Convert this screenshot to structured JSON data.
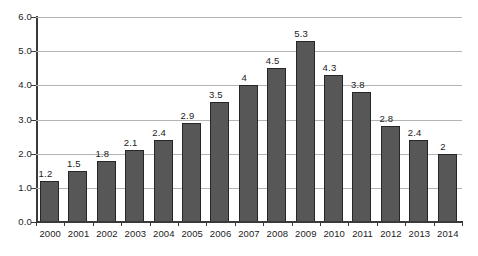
{
  "chart_data": {
    "type": "bar",
    "title": "",
    "subtitle": "",
    "xlabel": "",
    "ylabel": "",
    "categories": [
      "2000",
      "2001",
      "2002",
      "2003",
      "2004",
      "2005",
      "2006",
      "2007",
      "2008",
      "2009",
      "2010",
      "2011",
      "2012",
      "2013",
      "2014"
    ],
    "values": [
      1.2,
      1.5,
      1.8,
      2.1,
      2.4,
      2.9,
      3.5,
      4,
      4.5,
      5.3,
      4.3,
      3.8,
      2.8,
      2.4,
      2
    ],
    "value_labels": [
      "1.2",
      "1.5",
      "1.8",
      "2.1",
      "2.4",
      "2.9",
      "3.5",
      "4",
      "4.5",
      "5.3",
      "4.3",
      "3.8",
      "2.8",
      "2.4",
      "2"
    ],
    "ylim": [
      0,
      6
    ],
    "ytick_values": [
      0,
      1,
      2,
      3,
      4,
      5,
      6
    ],
    "ytick_labels": [
      "0.0",
      "1.0",
      "2.0",
      "3.0",
      "4.0",
      "5.0",
      "6.0"
    ],
    "grid": true,
    "grid_axis": "y",
    "legend": false,
    "legend_position": "none",
    "data_labels": true,
    "data_label_position": "above-bar",
    "series": [
      {
        "name": "",
        "values": [
          1.2,
          1.5,
          1.8,
          2.1,
          2.4,
          2.9,
          3.5,
          4,
          4.5,
          5.3,
          4.3,
          3.8,
          2.8,
          2.4,
          2
        ]
      }
    ],
    "colors": {
      "bar_fill": "#575757",
      "bar_border": "#262626",
      "gridline": "#b4b4b4",
      "axis": "#3a3a3a",
      "text": "#1c1c1c",
      "background": "#ffffff"
    }
  }
}
